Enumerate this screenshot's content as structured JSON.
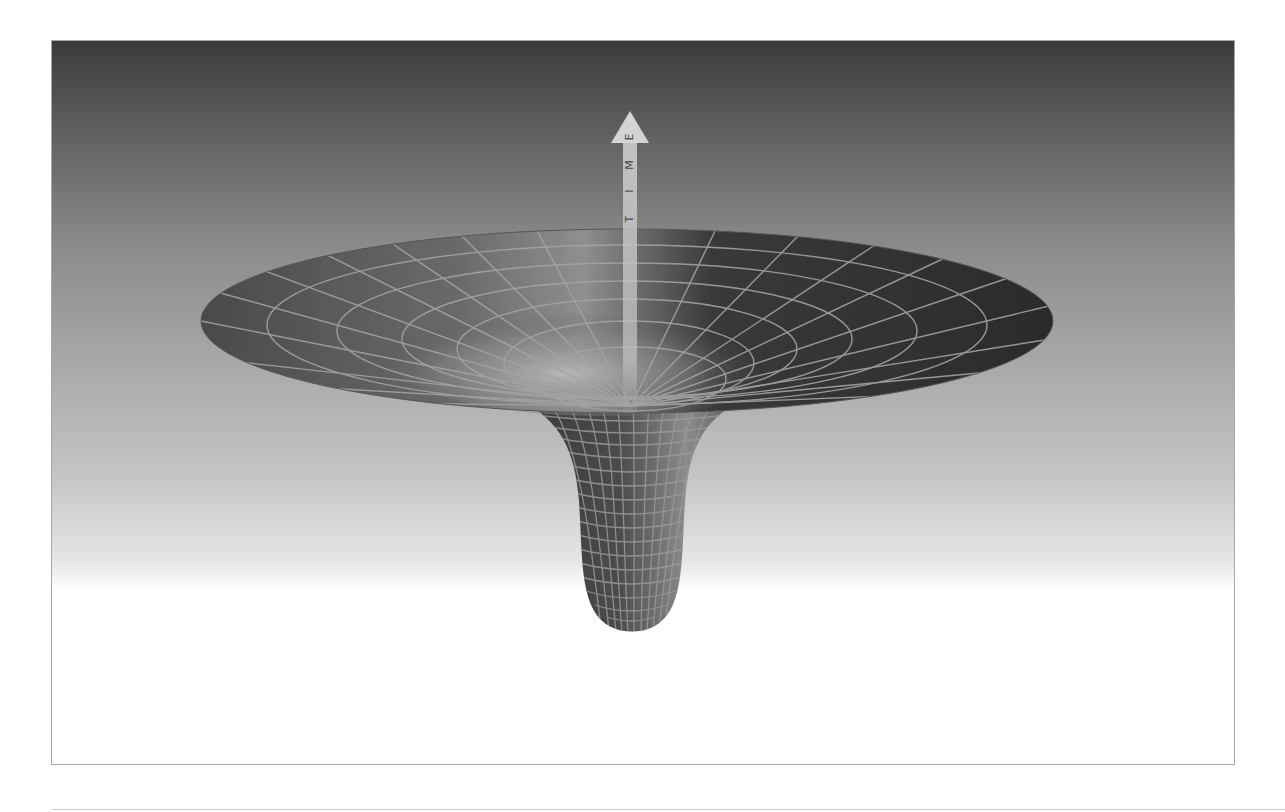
{
  "figure": {
    "arrow_label": "TIME",
    "arrow_letters": [
      "T",
      "I",
      "M",
      "E"
    ],
    "colors": {
      "background_top": "#3b3b3b",
      "background_bottom": "#ffffff",
      "surface_dark": "#2e2e2e",
      "surface_light": "#9a9a9a",
      "grid_lines": "#9c9c9c",
      "arrow_fill": "#c9c9c9",
      "frame_border": "#a8a8a8"
    }
  }
}
